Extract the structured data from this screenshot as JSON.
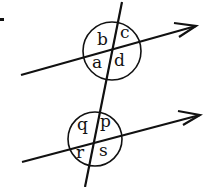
{
  "diagram": {
    "upper_intersection": {
      "labels": {
        "top_left": "b",
        "top_right": "c",
        "bottom_left": "a",
        "bottom_right": "d"
      }
    },
    "lower_intersection": {
      "labels": {
        "top_left": "q",
        "top_right": "p",
        "bottom_left": "r",
        "bottom_right": "s"
      }
    },
    "stroke_color": "#111111",
    "background": "#ffffff"
  }
}
